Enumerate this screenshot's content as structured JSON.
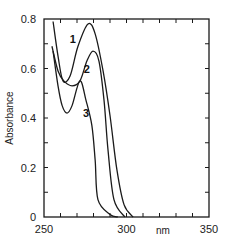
{
  "chart_data": {
    "type": "line",
    "title": "",
    "xlabel": "nm",
    "ylabel": "Absorbance",
    "xlim": [
      250,
      350
    ],
    "ylim": [
      0,
      0.8
    ],
    "x_ticks_major": [
      250,
      300,
      350
    ],
    "x_tick_labels": [
      "250",
      "300",
      "350"
    ],
    "x_minor_tick_step": 10,
    "y_ticks_major": [
      0,
      0.2,
      0.4,
      0.6,
      0.8
    ],
    "y_tick_labels": [
      "0",
      "0.2",
      "0.4",
      "0.6",
      "0.8"
    ],
    "y_minor_tick_step": 0.1,
    "grid": false,
    "legend": "inline curve numbers",
    "series": [
      {
        "name": "1",
        "x": [
          255.5,
          258.5,
          261.5,
          265.8,
          270.6,
          276.7,
          281.0,
          285.8,
          290.0,
          294.2,
          298.5,
          304.0
        ],
        "y": [
          0.79,
          0.65,
          0.55,
          0.57,
          0.69,
          0.78,
          0.74,
          0.59,
          0.41,
          0.19,
          0.05,
          0.0
        ],
        "label_pos": [
          267.5,
          0.72
        ]
      },
      {
        "name": "2",
        "x": [
          254.8,
          258.5,
          262.0,
          267.0,
          271.8,
          276.0,
          279.7,
          283.3,
          286.4,
          288.8,
          292.4,
          299.0
        ],
        "y": [
          0.69,
          0.59,
          0.55,
          0.53,
          0.55,
          0.63,
          0.67,
          0.63,
          0.47,
          0.27,
          0.07,
          0.0
        ],
        "label_pos": [
          276.0,
          0.6
        ]
      },
      {
        "name": "3",
        "x": [
          255.5,
          258.5,
          261.0,
          264.0,
          267.0,
          271.8,
          275.5,
          279.0,
          281.0,
          282.7,
          290.0,
          294.8
        ],
        "y": [
          0.67,
          0.53,
          0.45,
          0.42,
          0.45,
          0.55,
          0.47,
          0.37,
          0.23,
          0.07,
          0.01,
          0.0
        ],
        "label_pos": [
          275.5,
          0.42
        ]
      }
    ]
  }
}
